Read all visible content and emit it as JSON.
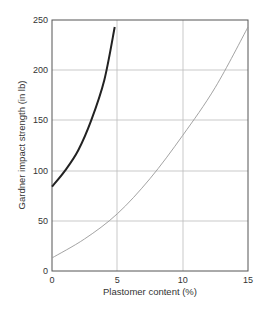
{
  "chart_data": {
    "type": "line",
    "title": "",
    "xlabel": "Plastomer content (%)",
    "ylabel": "Gardner impact strength (in lb)",
    "xlim": [
      0,
      15
    ],
    "ylim": [
      0,
      250
    ],
    "x_ticks": [
      "0",
      "5",
      "10",
      "15"
    ],
    "y_ticks": [
      "0",
      "50",
      "100",
      "150",
      "200",
      "250"
    ],
    "grid": true,
    "legend": null,
    "series": [
      {
        "name": "dark curve",
        "style": "thick dark",
        "x": [
          0,
          1,
          2,
          3,
          4,
          4.8
        ],
        "y": [
          84,
          100,
          120,
          150,
          190,
          243
        ]
      },
      {
        "name": "light curve",
        "style": "thin light",
        "x": [
          0,
          2.5,
          5,
          7.5,
          10,
          12.5,
          15
        ],
        "y": [
          13,
          32,
          57,
          92,
          135,
          183,
          243
        ]
      }
    ]
  }
}
